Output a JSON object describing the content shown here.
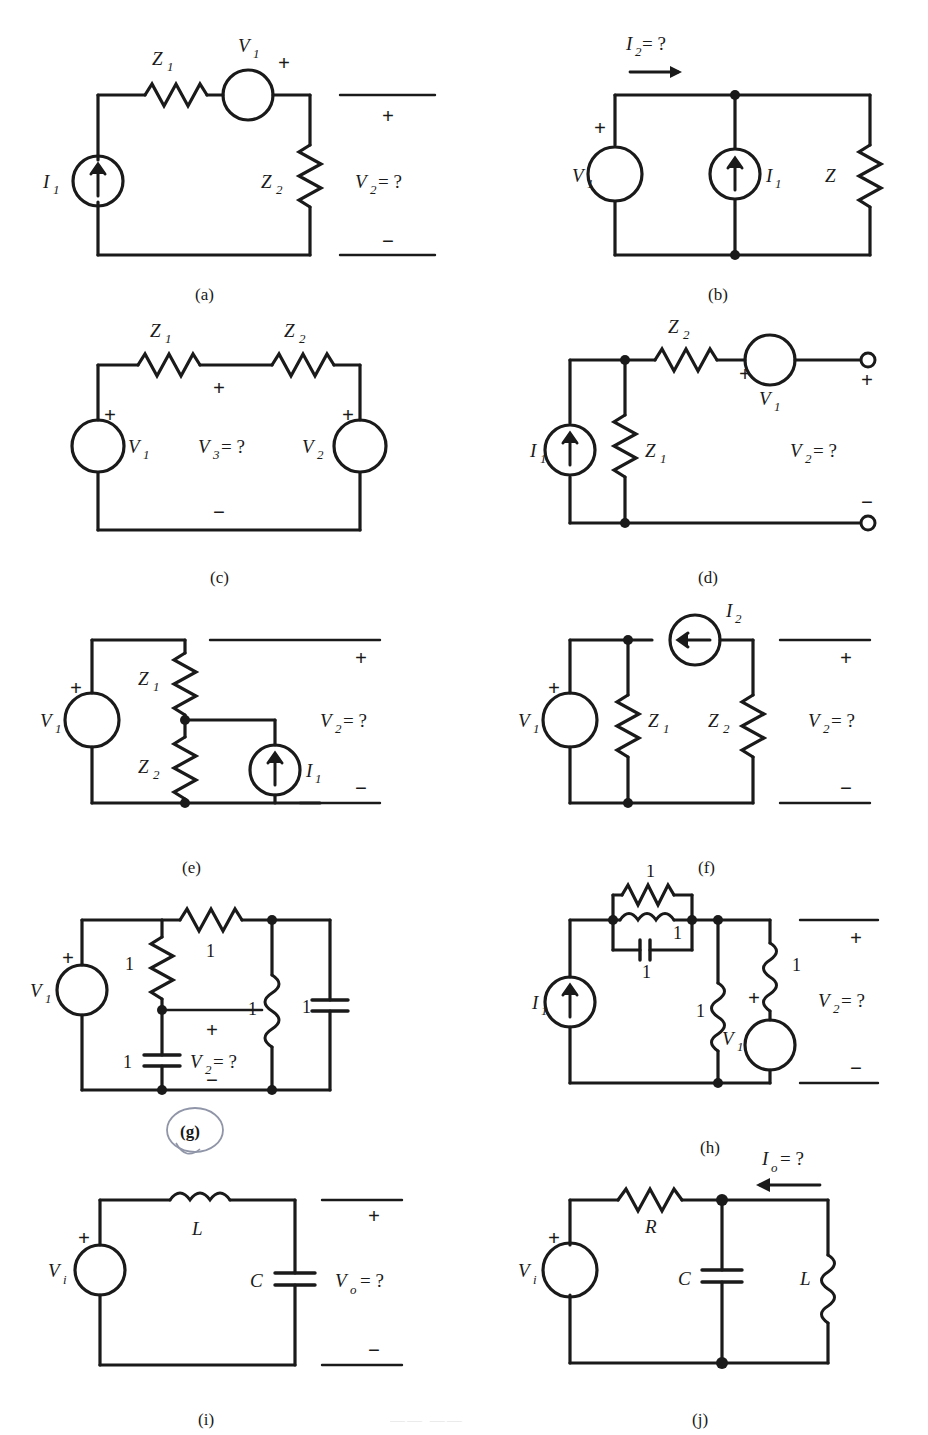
{
  "figure": {
    "type": "circuit-diagram-sheet",
    "panel_count": 10,
    "line_color": "#1a1a1a",
    "background": "#ffffff",
    "annotation_color": "#8a8fa0"
  },
  "panels": [
    {
      "id": "a",
      "caption": "(a)",
      "unknown": "V₂ = ?",
      "unknown_base": "V",
      "unknown_sub": "2",
      "unknown_tail": " = ?",
      "components": [
        {
          "name": "current-source",
          "label": "I",
          "sub": "1",
          "kind": "current-source"
        },
        {
          "name": "impedance-z1",
          "label": "Z",
          "sub": "1",
          "kind": "resistor"
        },
        {
          "name": "voltage-source-v1",
          "label": "V",
          "sub": "1",
          "kind": "voltage-source"
        },
        {
          "name": "impedance-z2",
          "label": "Z",
          "sub": "2",
          "kind": "resistor"
        }
      ],
      "polarity": {
        "plus": "+",
        "minus": "−"
      }
    },
    {
      "id": "b",
      "caption": "(b)",
      "unknown": "I₂ = ?",
      "unknown_base": "I",
      "unknown_sub": "2",
      "unknown_tail": " = ?",
      "components": [
        {
          "name": "voltage-source-v1",
          "label": "V",
          "sub": "1",
          "kind": "voltage-source"
        },
        {
          "name": "current-source-i1",
          "label": "I",
          "sub": "1",
          "kind": "current-source"
        },
        {
          "name": "impedance-z",
          "label": "Z",
          "sub": "",
          "kind": "resistor"
        }
      ],
      "polarity": {
        "plus": "+",
        "minus": "−"
      }
    },
    {
      "id": "c",
      "caption": "(c)",
      "unknown": "V₃ = ?",
      "unknown_base": "V",
      "unknown_sub": "3",
      "unknown_tail": " = ?",
      "components": [
        {
          "name": "voltage-source-v1",
          "label": "V",
          "sub": "1",
          "kind": "voltage-source"
        },
        {
          "name": "impedance-z1",
          "label": "Z",
          "sub": "1",
          "kind": "resistor"
        },
        {
          "name": "impedance-z2",
          "label": "Z",
          "sub": "2",
          "kind": "resistor"
        },
        {
          "name": "voltage-source-v2",
          "label": "V",
          "sub": "2",
          "kind": "voltage-source"
        }
      ],
      "polarity": {
        "plus": "+",
        "minus": "−"
      }
    },
    {
      "id": "d",
      "caption": "(d)",
      "unknown": "V₂ = ?",
      "unknown_base": "V",
      "unknown_sub": "2",
      "unknown_tail": " = ?",
      "components": [
        {
          "name": "current-source-i1",
          "label": "I",
          "sub": "1",
          "kind": "current-source"
        },
        {
          "name": "impedance-z1",
          "label": "Z",
          "sub": "1",
          "kind": "resistor"
        },
        {
          "name": "impedance-z2",
          "label": "Z",
          "sub": "2",
          "kind": "resistor"
        },
        {
          "name": "voltage-source-v1",
          "label": "V",
          "sub": "1",
          "kind": "voltage-source"
        }
      ],
      "polarity": {
        "plus": "+",
        "minus": "−"
      },
      "terminals": "open-circles"
    },
    {
      "id": "e",
      "caption": "(e)",
      "unknown": "V₂ = ?",
      "unknown_base": "V",
      "unknown_sub": "2",
      "unknown_tail": " = ?",
      "components": [
        {
          "name": "voltage-source-v1",
          "label": "V",
          "sub": "1",
          "kind": "voltage-source"
        },
        {
          "name": "impedance-z1",
          "label": "Z",
          "sub": "1",
          "kind": "resistor"
        },
        {
          "name": "impedance-z2",
          "label": "Z",
          "sub": "2",
          "kind": "resistor"
        },
        {
          "name": "current-source-i1",
          "label": "I",
          "sub": "1",
          "kind": "current-source"
        }
      ],
      "polarity": {
        "plus": "+",
        "minus": "−"
      }
    },
    {
      "id": "f",
      "caption": "(f)",
      "unknown": "V₂ = ?",
      "unknown_base": "V",
      "unknown_sub": "2",
      "unknown_tail": " = ?",
      "components": [
        {
          "name": "voltage-source-v1",
          "label": "V",
          "sub": "1",
          "kind": "voltage-source"
        },
        {
          "name": "current-source-i2",
          "label": "I",
          "sub": "2",
          "kind": "current-source"
        },
        {
          "name": "impedance-z1",
          "label": "Z",
          "sub": "1",
          "kind": "resistor"
        },
        {
          "name": "impedance-z2",
          "label": "Z",
          "sub": "2",
          "kind": "resistor"
        }
      ],
      "polarity": {
        "plus": "+",
        "minus": "−"
      }
    },
    {
      "id": "g",
      "caption": "(g)",
      "caption_circled": true,
      "unknown": "V₂ = ?",
      "unknown_base": "V",
      "unknown_sub": "2",
      "unknown_tail": " = ?",
      "components": [
        {
          "name": "voltage-source-v1",
          "label": "V",
          "sub": "1",
          "kind": "voltage-source"
        },
        {
          "name": "series-resistor",
          "label": "1",
          "kind": "resistor"
        },
        {
          "name": "shunt-resistor",
          "label": "1",
          "kind": "resistor"
        },
        {
          "name": "shunt-capacitor",
          "label": "1",
          "kind": "capacitor"
        },
        {
          "name": "shunt-inductor",
          "label": "1",
          "kind": "inductor"
        },
        {
          "name": "output-capacitor",
          "label": "1",
          "kind": "capacitor"
        }
      ],
      "polarity": {
        "plus": "+",
        "minus": "−"
      }
    },
    {
      "id": "h",
      "caption": "(h)",
      "unknown": "V₂ = ?",
      "unknown_base": "V",
      "unknown_sub": "2",
      "unknown_tail": " = ?",
      "components": [
        {
          "name": "current-source-i1",
          "label": "I",
          "sub": "1",
          "kind": "current-source"
        },
        {
          "name": "parallel-resistor",
          "label": "1",
          "kind": "resistor"
        },
        {
          "name": "parallel-inductor",
          "label": "1",
          "kind": "inductor"
        },
        {
          "name": "parallel-capacitor",
          "label": "1",
          "kind": "capacitor"
        },
        {
          "name": "shunt-inductor",
          "label": "1",
          "kind": "inductor"
        },
        {
          "name": "voltage-source-v1",
          "label": "V",
          "sub": "1",
          "kind": "voltage-source"
        },
        {
          "name": "output-inductor",
          "label": "1",
          "kind": "inductor"
        }
      ],
      "polarity": {
        "plus": "+",
        "minus": "−"
      }
    },
    {
      "id": "i",
      "caption": "(i)",
      "unknown": "Vₒ = ?",
      "unknown_base": "V",
      "unknown_sub": "o",
      "unknown_tail": " = ?",
      "components": [
        {
          "name": "source-vi",
          "label": "V",
          "sub": "i",
          "kind": "voltage-source"
        },
        {
          "name": "inductor-l",
          "label": "L",
          "kind": "inductor"
        },
        {
          "name": "capacitor-c",
          "label": "C",
          "kind": "capacitor"
        }
      ],
      "polarity": {
        "plus": "+",
        "minus": "−"
      }
    },
    {
      "id": "j",
      "caption": "(j)",
      "unknown": "Iₒ = ?",
      "unknown_base": "I",
      "unknown_sub": "o",
      "unknown_tail": " = ?",
      "components": [
        {
          "name": "source-vi",
          "label": "V",
          "sub": "i",
          "kind": "voltage-source"
        },
        {
          "name": "resistor-r",
          "label": "R",
          "kind": "resistor"
        },
        {
          "name": "capacitor-c",
          "label": "C",
          "kind": "capacitor"
        },
        {
          "name": "inductor-l",
          "label": "L",
          "kind": "inductor"
        }
      ],
      "polarity": {
        "plus": "+",
        "minus": "−"
      }
    }
  ],
  "glyphs": {
    "plus": "+",
    "minus": "−",
    "equals_q": " = ?"
  }
}
